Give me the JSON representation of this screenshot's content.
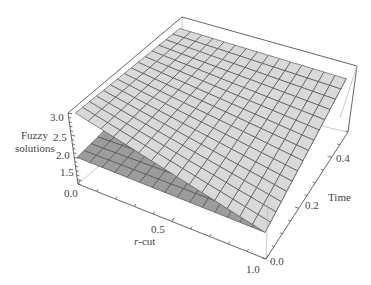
{
  "chart_data": {
    "type": "surface3d",
    "title": "",
    "xlabel": "r-cut",
    "ylabel": "Time",
    "zlabel": "Fuzzy solutions",
    "x_ticks": [
      "0.0",
      "0.5",
      "1.0"
    ],
    "y_ticks": [
      "0.0",
      "0.2",
      "0.4"
    ],
    "z_ticks": [
      "1.5",
      "2.0",
      "2.5",
      "3.0"
    ],
    "xlim": [
      0,
      1
    ],
    "ylim": [
      0,
      0.5
    ],
    "zlim": [
      1.4,
      3.0
    ],
    "series": [
      {
        "name": "upper solution",
        "color": "#d9d9d9",
        "corners": {
          "r0_t0": 3.0,
          "r0_t05": 2.9,
          "r1_t0": 2.0,
          "r1_t05": 2.6
        }
      },
      {
        "name": "lower solution",
        "color": "#9c9c9c",
        "corners": {
          "r0_t0": 2.0,
          "r0_t05": 2.3,
          "r1_t0": 2.0,
          "r1_t05": 2.6
        }
      }
    ],
    "grid": false,
    "mesh": "15x15"
  },
  "labels": {
    "zlabel_line1": "Fuzzy",
    "zlabel_line2": "solutions",
    "xlabel_prefix": "r",
    "xlabel_suffix": "-cut",
    "ylabel": "Time"
  }
}
